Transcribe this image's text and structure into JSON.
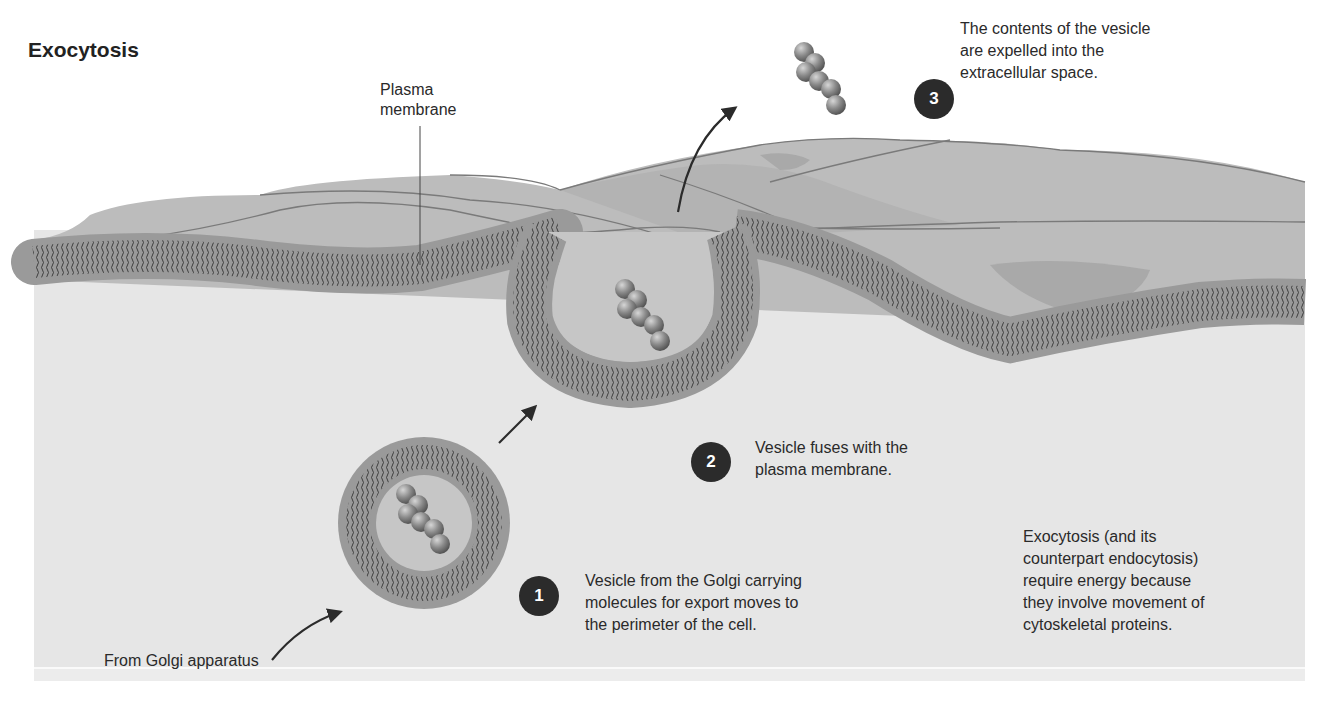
{
  "title": "Exocytosis",
  "labels": {
    "plasma_membrane": [
      "Plasma",
      "membrane"
    ],
    "from_golgi": "From Golgi apparatus",
    "note": [
      "Exocytosis (and its",
      "counterpart endocytosis)",
      "require energy because",
      "they involve movement of",
      "cytoskeletal proteins."
    ]
  },
  "steps": [
    {
      "number": "1",
      "lines": [
        "Vesicle from the Golgi carrying",
        "molecules for export moves to",
        "the perimeter of the cell."
      ]
    },
    {
      "number": "2",
      "lines": [
        "Vesicle fuses with the",
        "plasma membrane."
      ]
    },
    {
      "number": "3",
      "lines": [
        "The contents of the vesicle",
        "are expelled into the",
        "extracellular space."
      ]
    }
  ],
  "colors": {
    "background": "#ffffff",
    "cytoplasm": "#e6e6e6",
    "extracellular": "#b9b9b9",
    "extracellular_dark": "#a9a9a9",
    "membrane_head": "#9a9a9a",
    "tail_stroke": "#333333",
    "badge": "#2b2b2b",
    "molecule": "#8d8d8d"
  }
}
